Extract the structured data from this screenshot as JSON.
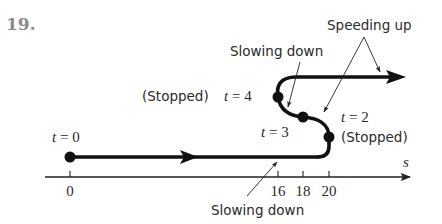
{
  "problem_number": "19.",
  "axis": {
    "variable": "s",
    "ticks": [
      {
        "label": "0",
        "x": 70
      },
      {
        "label": "16",
        "x": 278
      },
      {
        "label": "18",
        "x": 303
      },
      {
        "label": "20",
        "x": 329
      }
    ]
  },
  "points": [
    {
      "time_label": "t = 0",
      "position": "0"
    },
    {
      "time_label": "t = 2",
      "position": "20",
      "note": "(Stopped)"
    },
    {
      "time_label": "t = 3",
      "position": "18"
    },
    {
      "time_label": "t = 4",
      "position": "16",
      "note": "(Stopped)"
    }
  ],
  "labels": {
    "t0": "t = 0",
    "t2": "t = 2",
    "t3": "t = 3",
    "t4": "t = 4",
    "stopped_left": "(Stopped)",
    "stopped_right": "(Stopped)",
    "slowing_down_top": "Slowing down",
    "slowing_down_bottom": "Slowing down",
    "speeding_up": "Speeding up"
  },
  "colors": {
    "path": "#111111",
    "text": "#2a2a2a",
    "problem_number": "#8a8a8a"
  }
}
